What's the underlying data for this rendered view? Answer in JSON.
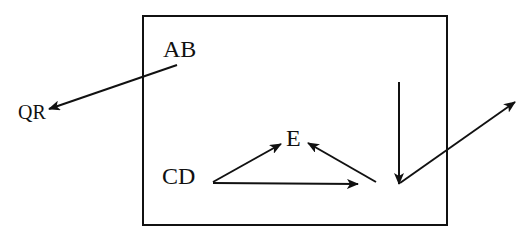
{
  "diagram": {
    "colors": {
      "stroke": "#111111",
      "background": "#ffffff"
    },
    "box": {
      "x": 143,
      "y": 16,
      "width": 304,
      "height": 209
    },
    "nodes": [
      {
        "id": "AB",
        "label": "AB",
        "x": 163,
        "y": 57
      },
      {
        "id": "QR",
        "label": "QR",
        "x": 18,
        "y": 119
      },
      {
        "id": "E",
        "label": "E",
        "x": 286,
        "y": 146
      },
      {
        "id": "CD",
        "label": "CD",
        "x": 162,
        "y": 184
      }
    ],
    "arrows": [
      {
        "id": "ab-to-qr",
        "from": "AB",
        "to": "QR",
        "x1": 177,
        "y1": 65,
        "x2": 49,
        "y2": 109
      },
      {
        "id": "cd-to-e",
        "from": "CD",
        "to": "E",
        "x1": 213,
        "y1": 182,
        "x2": 281,
        "y2": 144
      },
      {
        "id": "cd-to-right",
        "from": "CD",
        "to": "point",
        "x1": 213,
        "y1": 183,
        "x2": 358,
        "y2": 184
      },
      {
        "id": "point-to-e",
        "from": "point",
        "to": "E",
        "x1": 376,
        "y1": 182,
        "x2": 308,
        "y2": 143
      },
      {
        "id": "down-arrow",
        "from": "top",
        "to": "point",
        "x1": 399,
        "y1": 82,
        "x2": 399,
        "y2": 184
      },
      {
        "id": "point-to-outside",
        "from": "point",
        "to": "outside",
        "x1": 400,
        "y1": 183,
        "x2": 515,
        "y2": 102
      }
    ]
  }
}
